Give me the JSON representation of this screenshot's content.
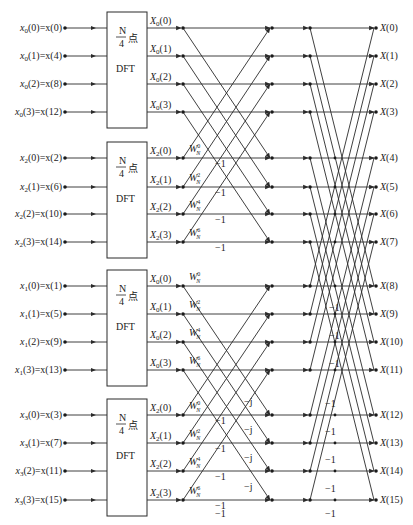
{
  "colors": {
    "line": "#2a2a2a",
    "background": "#ffffff",
    "text": "#222222"
  },
  "groups": [
    {
      "name": "x0",
      "box": {
        "line1": "N",
        "line2": "4",
        "suffix": "点",
        "line3": "DFT"
      },
      "inputs": [
        "x0(0)=x(0)",
        "x0(1)=x(4)",
        "x0(2)=x(8)",
        "x0(3)=x(12)"
      ],
      "outputs": [
        "X0(0)",
        "X0(1)",
        "X0(2)",
        "X0(3)"
      ],
      "twiddles": []
    },
    {
      "name": "x2",
      "box": {
        "line1": "N",
        "line2": "4",
        "suffix": "点",
        "line3": "DFT"
      },
      "inputs": [
        "x2(0)=x(2)",
        "x2(1)=x(6)",
        "x2(2)=x(10)",
        "x2(3)=x(14)"
      ],
      "outputs": [
        "X2(0)",
        "X2(1)",
        "X2(2)",
        "X2(3)"
      ],
      "twiddles": [
        "W_N^0",
        "W_N^2",
        "W_N^4",
        "W_N^6"
      ]
    },
    {
      "name": "x1",
      "box": {
        "line1": "N",
        "line2": "4",
        "suffix": "点",
        "line3": "DFT"
      },
      "inputs": [
        "x1(0)=x(1)",
        "x1(1)=x(5)",
        "x1(2)=x(9)",
        "x1(3)=x(13)"
      ],
      "outputs": [
        "X0(0)",
        "X0(1)",
        "X0(2)",
        "X0(3)"
      ],
      "twiddles": [
        "W_N^0",
        "W_N^2",
        "W_N^4",
        "W_N^6"
      ]
    },
    {
      "name": "x3",
      "box": {
        "line1": "N",
        "line2": "4",
        "suffix": "点",
        "line3": "DFT"
      },
      "inputs": [
        "x3(0)=x(3)",
        "x3(1)=x(7)",
        "x3(2)=x(11)",
        "x3(3)=x(15)"
      ],
      "outputs": [
        "X2(0)",
        "X2(1)",
        "X2(2)",
        "X2(3)"
      ],
      "twiddles": [
        "W_N^0",
        "W_N^2",
        "W_N^4",
        "W_N^6"
      ]
    }
  ],
  "final_outputs": [
    "X(0)",
    "X(1)",
    "X(2)",
    "X(3)",
    "X(4)",
    "X(5)",
    "X(6)",
    "X(7)",
    "X(8)",
    "X(9)",
    "X(10)",
    "X(11)",
    "X(12)",
    "X(13)",
    "X(14)",
    "X(15)"
  ],
  "stage2_neg_label": "−1",
  "stage2_j_label": "−j",
  "stage3_neg_label": "−1"
}
